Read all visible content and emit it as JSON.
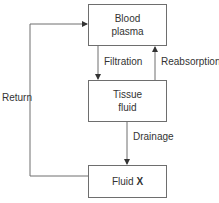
{
  "diagram": {
    "nodes": {
      "blood_plasma": {
        "line1": "Blood",
        "line2": "plasma"
      },
      "tissue_fluid": {
        "line1": "Tissue",
        "line2": "fluid"
      },
      "fluid_x": {
        "prefix": "Fluid ",
        "bold": "X"
      }
    },
    "edges": {
      "filtration": "Filtration",
      "reabsorption": "Reabsorption",
      "drainage": "Drainage",
      "return": "Return"
    },
    "colors": {
      "line": "#6e6e6e",
      "text": "#333333"
    }
  }
}
